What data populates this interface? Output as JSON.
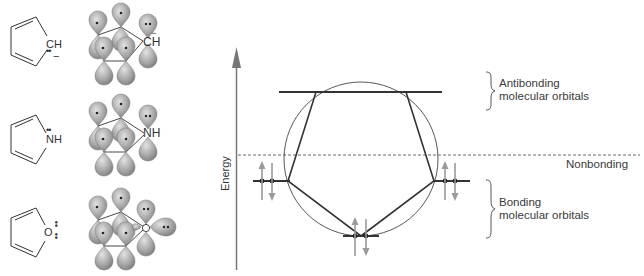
{
  "figure": {
    "molecules": [
      {
        "name": "cyclopentadienyl-anion",
        "atom_label": "CH",
        "charge": "−",
        "heteroatom_label": "CH",
        "heteroatom_charge": "−",
        "lone_pair": "••"
      },
      {
        "name": "pyrrole",
        "atom_label": "NH",
        "heteroatom_label": "NH",
        "lone_pair": "••"
      },
      {
        "name": "furan",
        "atom_label": "O",
        "heteroatom_label": "O",
        "lone_pair": "••"
      }
    ],
    "orbital_dot": "•",
    "axis": {
      "label": "Energy"
    },
    "levels": {
      "antibonding": {
        "label_line1": "Antibonding",
        "label_line2": "molecular orbitals"
      },
      "nonbonding": {
        "label": "Nonbonding"
      },
      "bonding": {
        "label_line1": "Bonding",
        "label_line2": "molecular orbitals"
      }
    },
    "frost_circle": {
      "vertices": [
        {
          "position": "bottom",
          "electrons": 2
        },
        {
          "position": "lower-left",
          "electrons": 2
        },
        {
          "position": "lower-right",
          "electrons": 2
        },
        {
          "position": "upper-left",
          "electrons": 0
        },
        {
          "position": "upper-right",
          "electrons": 0
        }
      ],
      "total_pi_electrons": 6
    },
    "colors": {
      "line": "#333333",
      "lobe_fill": "#a8a8a8",
      "arrow_gray": "#999999",
      "axis_gray": "#777777"
    }
  }
}
